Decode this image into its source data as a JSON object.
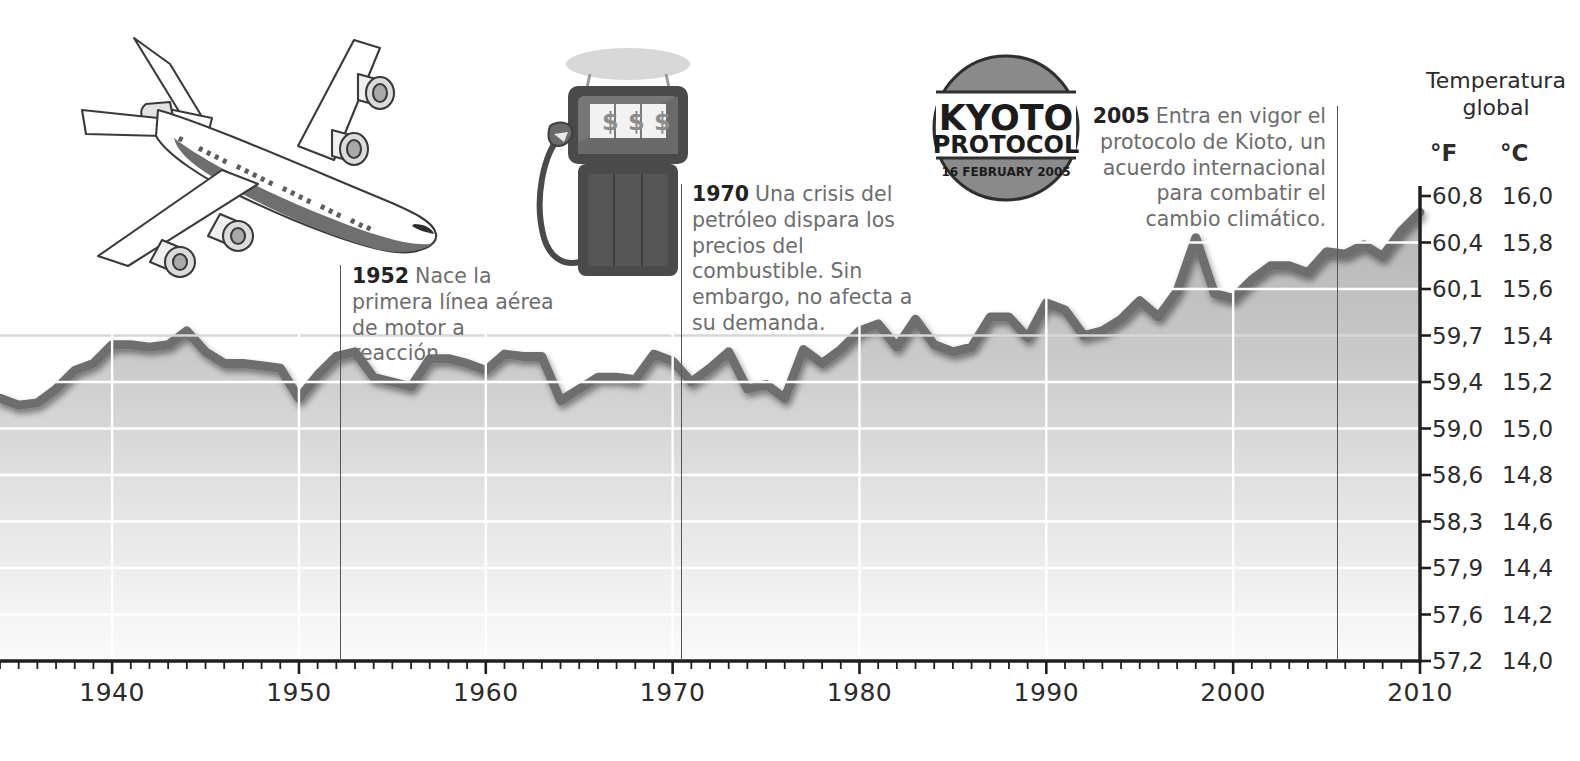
{
  "chart_data": {
    "type": "area",
    "title": "Temperatura global",
    "xlabel": "",
    "ylabel": "Temperatura global",
    "grid": true,
    "legend": "none",
    "xlim": [
      1934,
      2010
    ],
    "ylim_c": [
      14.0,
      16.0
    ],
    "ylim_f": [
      57.2,
      60.8
    ],
    "x_ticks": [
      1940,
      1950,
      1960,
      1970,
      1980,
      1990,
      2000,
      2010
    ],
    "y_ticks_f": [
      "60,8",
      "60,4",
      "60,1",
      "59,7",
      "59,4",
      "59,0",
      "58,6",
      "58,3",
      "57,9",
      "57,6",
      "57,2"
    ],
    "y_ticks_c": [
      "16,0",
      "15,8",
      "15,6",
      "15,4",
      "15,2",
      "15,0",
      "14,8",
      "14,6",
      "14,4",
      "14,2",
      "14,0"
    ],
    "series_name": "Temperatura media global",
    "x": [
      1934,
      1935,
      1936,
      1937,
      1938,
      1939,
      1940,
      1941,
      1942,
      1943,
      1944,
      1945,
      1946,
      1947,
      1948,
      1949,
      1950,
      1951,
      1952,
      1953,
      1954,
      1955,
      1956,
      1957,
      1958,
      1959,
      1960,
      1961,
      1962,
      1963,
      1964,
      1965,
      1966,
      1967,
      1968,
      1969,
      1970,
      1971,
      1972,
      1973,
      1974,
      1975,
      1976,
      1977,
      1978,
      1979,
      1980,
      1981,
      1982,
      1983,
      1984,
      1985,
      1986,
      1987,
      1988,
      1989,
      1990,
      1991,
      1992,
      1993,
      1994,
      1995,
      1996,
      1997,
      1998,
      1999,
      2000,
      2001,
      2002,
      2003,
      2004,
      2005,
      2006,
      2007,
      2008,
      2009,
      2010
    ],
    "values_c": [
      15.13,
      15.1,
      15.11,
      15.17,
      15.25,
      15.28,
      15.36,
      15.36,
      15.35,
      15.36,
      15.42,
      15.33,
      15.28,
      15.28,
      15.27,
      15.26,
      15.13,
      15.23,
      15.31,
      15.33,
      15.22,
      15.2,
      15.18,
      15.3,
      15.3,
      15.28,
      15.25,
      15.32,
      15.31,
      15.31,
      15.12,
      15.17,
      15.22,
      15.22,
      15.21,
      15.32,
      15.29,
      15.2,
      15.26,
      15.33,
      15.17,
      15.19,
      15.13,
      15.34,
      15.28,
      15.34,
      15.42,
      15.45,
      15.35,
      15.47,
      15.36,
      15.33,
      15.35,
      15.48,
      15.48,
      15.39,
      15.54,
      15.51,
      15.4,
      15.42,
      15.47,
      15.55,
      15.48,
      15.59,
      15.82,
      15.58,
      15.56,
      15.64,
      15.7,
      15.7,
      15.67,
      15.76,
      15.75,
      15.79,
      15.74,
      15.85,
      15.93
    ]
  },
  "y_axis": {
    "header_line1": "Temperatura",
    "header_line2": "global",
    "unit_f": "°F",
    "unit_c": "°C"
  },
  "annotations": [
    {
      "id": "1952",
      "year": "1952",
      "text": "Nace la primera línea aérea de motor a reacción."
    },
    {
      "id": "1970",
      "year": "1970",
      "text": "Una crisis del petróleo dispara los precios del combustible. Sin embargo, no afecta a su demanda."
    },
    {
      "id": "2005",
      "year": "2005",
      "text": "Entra en vigor el protocolo de Kioto, un acuerdo internacional para combatir el cambio climático."
    }
  ],
  "illustrations": {
    "airplane": "airplane-illustration",
    "fuel_pump": "fuel-pump-illustration",
    "fuel_pump_display": "$ $ $",
    "kyoto_badge": {
      "line1": "KYOTO",
      "line2": "PROTOCOL",
      "line3": "16 FEBRUARY 2005"
    }
  },
  "colors": {
    "line": "#6e6e6e",
    "fill_top": "#b9b9b9",
    "fill_bottom": "#fdfdfd",
    "grid": "#ffffff",
    "axis": "#222222",
    "text": "#6d6d6d",
    "badge": "#8a8a8a"
  }
}
